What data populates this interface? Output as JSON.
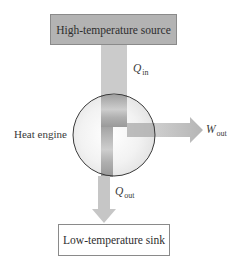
{
  "diagram": {
    "hot_reservoir": {
      "label": "High-temperature source"
    },
    "cold_reservoir": {
      "label": "Low-temperature sink"
    },
    "engine": {
      "label": "Heat engine"
    },
    "flows": {
      "heat_in": {
        "symbol": "Q",
        "subscript": "in"
      },
      "work_out": {
        "symbol": "W",
        "subscript": "out"
      },
      "heat_out": {
        "symbol": "Q",
        "subscript": "out"
      }
    },
    "colors": {
      "hot_box_fill": "#b3b3b3",
      "arrow_fill": "#c8c8c8",
      "circle_stroke": "#333333"
    }
  }
}
